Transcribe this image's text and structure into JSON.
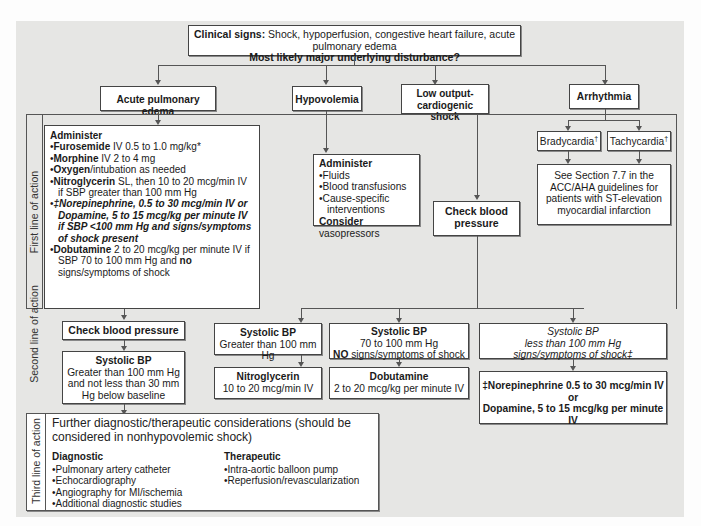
{
  "top": {
    "clinical_signs_label": "Clinical signs:",
    "clinical_signs_text": " Shock, hypoperfusion, congestive heart failure, acute pulmonary edema",
    "question": "Most likely major underlying disturbance?"
  },
  "categories": {
    "acute_pulmonary_edema": "Acute pulmonary edema",
    "hypovolemia": "Hypovolemia",
    "low_output": "Low output-cardiogenic shock",
    "arrhythmia": "Arrhythmia"
  },
  "lines_of_action": {
    "first": "First line of action",
    "second": "Second line of action",
    "third": "Third line of action"
  },
  "ape_first": {
    "heading": "Administer",
    "items": [
      {
        "bold": "Furosemide",
        "text": " IV 0.5 to 1.0 mg/kg*"
      },
      {
        "bold": "Morphine",
        "text": " IV 2 to 4 mg"
      },
      {
        "bold": "Oxygen",
        "text": "/intubation as needed"
      },
      {
        "bold": "Nitroglycerin",
        "text": " SL, then 10 to 20 mcg/min IV if SBP greater than 100 mm Hg"
      },
      {
        "bold_italic": "‡Norepinephrine, 0.5 to 30 mcg/min IV or Dopamine, 5 to 15 mcg/kg per minute IV if SBP <100 mm Hg and signs/symptoms of shock present"
      },
      {
        "bold": "Dobutamine",
        "text": " 2 to 20 mcg/kg per minute IV if SBP 70 to 100 mm Hg and ",
        "bold2": "no",
        "text2": " signs/symptoms of shock"
      }
    ]
  },
  "hypo_first": {
    "heading": "Administer",
    "items": [
      "Fluids",
      "Blood transfusions",
      "Cause-specific interventions"
    ],
    "consider_bold": "Consider",
    "consider_text": " vasopressors"
  },
  "low_output_check": "Check blood pressure",
  "arrhythmia": {
    "brady": "Bradycardia",
    "tachy": "Tachycardia",
    "dagger": "†",
    "see_section": "See Section 7.7 in the ACC/AHA guidelines for patients with ST-elevation myocardial infarction"
  },
  "second": {
    "check_bp": "Check blood pressure",
    "sbp_ape": {
      "title": "Systolic BP",
      "text": "Greater than 100 mm Hg and not less than 30 mm Hg below baseline"
    },
    "ace": {
      "title": "ACE Inhibitors",
      "text": "Short-acting agent such as captopril (1 to 6.25 mg)"
    },
    "sbp_gt100": {
      "title": "Systolic BP",
      "text": "Greater than 100 mm Hg"
    },
    "nitro": {
      "title": "Nitroglycerin",
      "text": "10 to 20 mcg/min IV"
    },
    "sbp_70_100": {
      "title": "Systolic BP",
      "text": "70 to 100 mm Hg",
      "no_bold": "NO",
      "no_text": " signs/symptoms of shock"
    },
    "dobutamine": {
      "title": "Dobutamine",
      "text": "2 to 20 mcg/kg per minute IV"
    },
    "sbp_lt100": {
      "title": "Systolic BP",
      "line2": "less than 100 mm Hg",
      "line3": "signs/symptoms of shock‡"
    },
    "pressors": {
      "line1": "‡Norepinephrine 0.5 to 30 mcg/min IV",
      "or": "or",
      "line2": "Dopamine, 5 to 15 mcg/kg per minute IV"
    }
  },
  "third": {
    "intro": "Further diagnostic/therapeutic considerations (should be considered in nonhypovolemic shock)",
    "diagnostic_title": "Diagnostic",
    "diagnostic_items": [
      "Pulmonary artery catheter",
      "Echocardiography",
      "Angiography for MI/ischemia",
      "Additional diagnostic studies"
    ],
    "therapeutic_title": "Therapeutic",
    "therapeutic_items": [
      "Intra-aortic balloon pump",
      "Reperfusion/revascularization"
    ]
  }
}
